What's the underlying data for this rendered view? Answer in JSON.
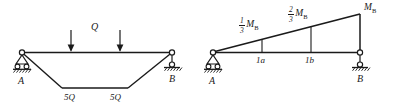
{
  "figure": {
    "stroke_color": "#1a1a1a",
    "background_color": "#ffffff"
  },
  "left_diagram": {
    "name": "loaded-frame-diagram",
    "supports": {
      "left_label": "A",
      "left_type": "pin-roller-support",
      "right_label": "B",
      "right_type": "roller-support"
    },
    "load_label": "Q",
    "load_arrows": 2,
    "member_labels": [
      "5Q",
      "5Q"
    ]
  },
  "right_diagram": {
    "name": "bending-moment-diagram",
    "supports": {
      "left_label": "A",
      "left_type": "pin-roller-support",
      "right_label": "B",
      "right_type": "roller-support"
    },
    "peak_label": "M",
    "peak_subscript": "B",
    "ordinates": [
      {
        "numerator": "1",
        "denominator": "3",
        "symbol": "M",
        "subscript": "B",
        "station": "1a"
      },
      {
        "numerator": "2",
        "denominator": "3",
        "symbol": "M",
        "subscript": "B",
        "station": "1b"
      }
    ],
    "station_labels": [
      "1a",
      "1b"
    ]
  }
}
